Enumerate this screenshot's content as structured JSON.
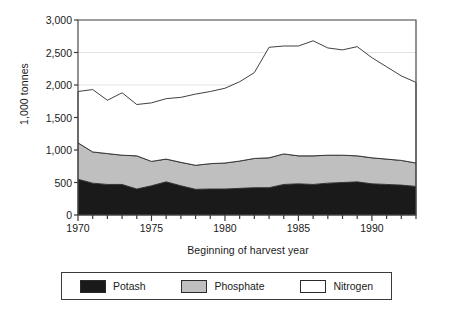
{
  "chart_data": {
    "type": "area",
    "stacked": true,
    "title": "",
    "xlabel": "Beginning of harvest year",
    "ylabel": "1,000 tonnes",
    "xlim": [
      1970,
      1993
    ],
    "ylim": [
      0,
      3000
    ],
    "yticks": [
      0,
      500,
      1000,
      1500,
      2000,
      2500,
      3000
    ],
    "ytick_labels": [
      "0",
      "500",
      "1,000",
      "1,500",
      "2,000",
      "2,500",
      "3,000"
    ],
    "xticks": [
      1970,
      1975,
      1980,
      1985,
      1990
    ],
    "xtick_labels": [
      "1970",
      "1975",
      "1980",
      "1985",
      "1990"
    ],
    "minor_xticks_every": 1,
    "grid": "horizontal-faint",
    "legend_position": "bottom",
    "x": [
      1970,
      1971,
      1972,
      1973,
      1974,
      1975,
      1976,
      1977,
      1978,
      1979,
      1980,
      1981,
      1982,
      1983,
      1984,
      1985,
      1986,
      1987,
      1988,
      1989,
      1990,
      1991,
      1992,
      1993
    ],
    "series": [
      {
        "name": "Potash",
        "color": "#1a1a1a",
        "values": [
          550,
          490,
          470,
          470,
          400,
          450,
          510,
          450,
          395,
          400,
          400,
          410,
          420,
          420,
          470,
          480,
          470,
          490,
          500,
          510,
          480,
          470,
          460,
          440
        ]
      },
      {
        "name": "Phosphate",
        "color": "#bfbfbf",
        "values": [
          560,
          480,
          475,
          450,
          510,
          375,
          350,
          360,
          370,
          390,
          400,
          420,
          450,
          460,
          470,
          430,
          440,
          430,
          420,
          400,
          400,
          390,
          380,
          360
        ]
      },
      {
        "name": "Nitrogen",
        "color": "#ffffff",
        "values": [
          790,
          960,
          820,
          960,
          790,
          900,
          930,
          1000,
          1095,
          1110,
          1150,
          1220,
          1320,
          1700,
          1660,
          1690,
          1770,
          1650,
          1620,
          1680,
          1540,
          1420,
          1300,
          1240
        ]
      }
    ],
    "totals": [
      1900,
      1930,
      1765,
      1880,
      1700,
      1725,
      1790,
      1810,
      1860,
      1900,
      1950,
      2050,
      2190,
      2580,
      2600,
      2600,
      2680,
      2570,
      2540,
      2590,
      2420,
      2280,
      2140,
      2040
    ]
  },
  "legend": {
    "items": [
      {
        "label": "Potash",
        "color": "#1a1a1a"
      },
      {
        "label": "Phosphate",
        "color": "#bfbfbf"
      },
      {
        "label": "Nitrogen",
        "color": "#ffffff"
      }
    ]
  }
}
